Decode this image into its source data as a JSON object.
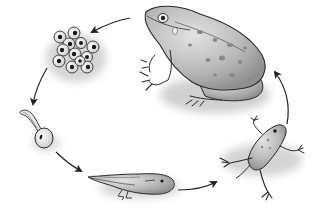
{
  "diagram": {
    "type": "cycle",
    "direction": "clockwise",
    "stages": [
      {
        "id": "adult-frog",
        "label": ""
      },
      {
        "id": "frog-eggs",
        "label": ""
      },
      {
        "id": "hatchling-tadpole",
        "label": ""
      },
      {
        "id": "tadpole-with-legs",
        "label": ""
      },
      {
        "id": "froglet",
        "label": ""
      }
    ],
    "arrows": [
      {
        "from": "adult-frog",
        "to": "frog-eggs"
      },
      {
        "from": "frog-eggs",
        "to": "hatchling-tadpole"
      },
      {
        "from": "hatchling-tadpole",
        "to": "tadpole-with-legs"
      },
      {
        "from": "tadpole-with-legs",
        "to": "froglet"
      },
      {
        "from": "froglet",
        "to": "adult-frog"
      }
    ],
    "colors": {
      "background": "#ffffff",
      "outline": "#2a2a2a",
      "body_fill": "#bdbdbd",
      "light_fill": "#e6e6e6",
      "spots": "#8a8a8a",
      "shadow": "#cfcfcf"
    }
  }
}
